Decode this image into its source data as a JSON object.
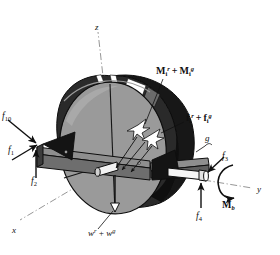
{
  "figure": {
    "domain": "diagram",
    "kind": "engineering-free-body-diagram",
    "background_color": "#ffffff",
    "ink_color": "#101010"
  },
  "palette": {
    "disk_face": "#9a9a9a",
    "disk_face_light": "#a6a6a6",
    "rim_dark": "#171717",
    "rim_mid": "#3a3a3a",
    "beam_top": "#8e8e8e",
    "beam_side": "#6e6e6e",
    "beam_dark": "#4a4a4a",
    "shaft_white": "#f4f4f4",
    "stripe_white": "#ffffff",
    "outline": "#0d0d0d"
  },
  "axes": [
    {
      "id": "z",
      "label": "z",
      "x": 95,
      "y": 23,
      "description": "vertical axis, dash-dot line going up from disk center"
    },
    {
      "id": "y",
      "label": "y",
      "x": 257,
      "y": 185,
      "description": "axis to the right along the shaft, dash-dot line"
    },
    {
      "id": "x",
      "label": "x",
      "x": 12,
      "y": 226,
      "description": "axis toward lower-left, dash-dot line"
    }
  ],
  "labels": [
    {
      "id": "f10",
      "kind": "force",
      "html": "f<sub>10</sub>",
      "text": "f10",
      "x": 2,
      "y": 112,
      "css_class": "force-lbl",
      "description": "force f sub 10, arrow pointing down-right into left beam end"
    },
    {
      "id": "f1",
      "kind": "force",
      "html": "f<sub>1</sub>",
      "text": "f1",
      "x": 8,
      "y": 146,
      "css_class": "force-lbl",
      "description": "force f sub 1, arrow pointing up-right into left beam end"
    },
    {
      "id": "f2",
      "kind": "force",
      "html": "f<sub>2</sub>",
      "text": "f2",
      "x": 31,
      "y": 177,
      "css_class": "force-lbl",
      "description": "force f sub 2, vertical arrow pointing up into left beam end"
    },
    {
      "id": "f3",
      "kind": "force",
      "html": "f<sub>3</sub>",
      "text": "f3",
      "x": 222,
      "y": 152,
      "css_class": "force-lbl",
      "description": "force f sub 3, arrow pointing down-left into right shaft end"
    },
    {
      "id": "f4",
      "kind": "force",
      "html": "f<sub>4</sub>",
      "text": "f4",
      "x": 196,
      "y": 212,
      "css_class": "force-lbl",
      "description": "force f sub 4, vertical arrow pointing up into right shaft end"
    },
    {
      "id": "Mb",
      "kind": "moment",
      "html": "M<sub>b</sub>",
      "text": "Mb",
      "x": 222,
      "y": 200,
      "css_class": "mb-lbl",
      "description": "bearing moment M sub b, circular arc arrow about the y axis"
    },
    {
      "id": "g",
      "kind": "annotation",
      "html": "g",
      "text": "g",
      "x": 205,
      "y": 140,
      "css_class": "axis-lbl",
      "description": "label g with short leader line to the rim segment"
    },
    {
      "id": "Mi",
      "kind": "moment",
      "html": "M<sub>i</sub><sup>r</sup>&#8201;+&#8201;M<sub>i</sub><sup>g</sup>",
      "text": "Mi^r + Mi^g",
      "x": 156,
      "y": 66,
      "css_class": "bold-lbl",
      "description": "bold label M sub i superscript r plus M sub i superscript g, leader line to white arrow cluster on disk"
    },
    {
      "id": "fi",
      "kind": "force",
      "html": "f<sub>i</sub><sup>r</sup>&#8201;+&#8201;f<sub>i</sub><sup>g</sup>",
      "text": "fi^r + fi^g",
      "x": 186,
      "y": 113,
      "css_class": "bold-lbl",
      "description": "bold label f sub i superscript r plus f sub i superscript g, leader line to white arrow cluster on disk"
    },
    {
      "id": "w",
      "kind": "weight",
      "html": "w<sup>r</sup>&#8201;+&#8201;w<sup>g</sup>",
      "text": "w^r + w^g",
      "x": 88,
      "y": 228,
      "css_class": "w-lbl",
      "description": "weight label w superscript r plus w superscript g, leader line to downward arrow at bottom of disk"
    }
  ]
}
